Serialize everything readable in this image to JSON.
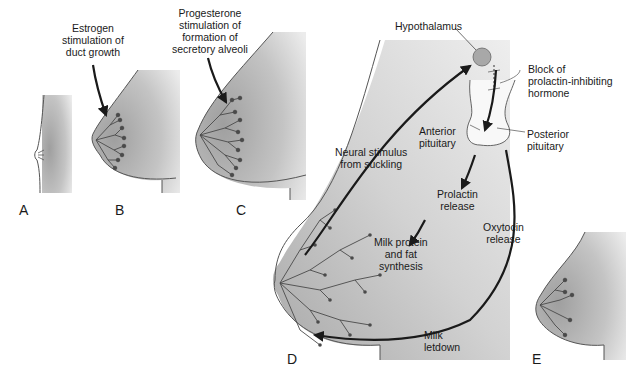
{
  "figure": {
    "panels": [
      {
        "id": "A",
        "label": "A"
      },
      {
        "id": "B",
        "label": "B"
      },
      {
        "id": "C",
        "label": "C"
      },
      {
        "id": "D",
        "label": "D"
      },
      {
        "id": "E",
        "label": "E"
      }
    ],
    "annotations": {
      "estrogen": [
        "Estrogen",
        "stimulation of",
        "duct growth"
      ],
      "progesterone": [
        "Progesterone",
        "stimulation of",
        "formation of",
        "secretory alveoli"
      ],
      "hypothalamus": "Hypothalamus",
      "block": [
        "Block of",
        "prolactin-inhibiting",
        "hormone"
      ],
      "anterior_pituitary": [
        "Anterior",
        "pituitary"
      ],
      "posterior_pituitary": [
        "Posterior",
        "pituitary"
      ],
      "neural_stimulus": [
        "Neural stimulus",
        "from suckling"
      ],
      "prolactin_release": [
        "Prolactin",
        "release"
      ],
      "oxytocin_release": [
        "Oxytocin",
        "release"
      ],
      "milk_synthesis": [
        "Milk protein",
        "and fat",
        "synthesis"
      ],
      "milk_letdown": [
        "Milk",
        "letdown"
      ]
    },
    "colors": {
      "tissue": "#b5b5b5",
      "tissue_light": "#e6e6e6",
      "outline": "#555555",
      "arrow": "#1a1a1a",
      "duct": "#4a4a4a"
    }
  }
}
